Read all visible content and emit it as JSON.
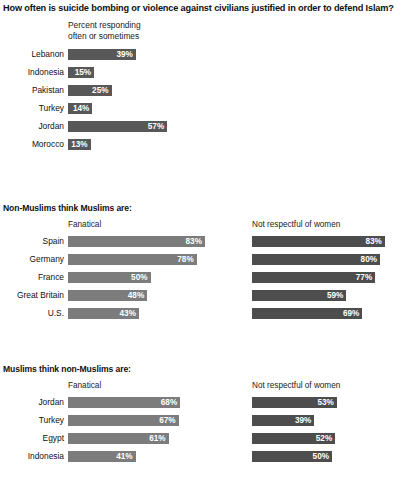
{
  "title": "How often is suicide bombing or violence against civilians justified in order to defend Islam?",
  "colors": {
    "bar_light": "#7c7c7c",
    "bar_dark": "#4d4d4d",
    "bar_solo": "#585858",
    "text": "#111111",
    "value_text": "#ffffff",
    "background": "#ffffff"
  },
  "sections": [
    {
      "heading": "",
      "note_line1": "Percent responding",
      "note_line2": "often or sometimes",
      "left_caption": "",
      "right_caption": "",
      "rows": [
        {
          "label": "Lebanon",
          "left": 39
        },
        {
          "label": "Indonesia",
          "left": 15
        },
        {
          "label": "Pakistan",
          "left": 25
        },
        {
          "label": "Turkey",
          "left": 14
        },
        {
          "label": "Jordan",
          "left": 57
        },
        {
          "label": "Morocco",
          "left": 13
        }
      ]
    },
    {
      "heading": "Non-Muslims think Muslims are:",
      "left_caption": "Fanatical",
      "right_caption": "Not respectful of women",
      "rows": [
        {
          "label": "Spain",
          "left": 83,
          "right": 83
        },
        {
          "label": "Germany",
          "left": 78,
          "right": 80
        },
        {
          "label": "France",
          "left": 50,
          "right": 77
        },
        {
          "label": "Great Britain",
          "left": 48,
          "right": 59
        },
        {
          "label": "U.S.",
          "left": 43,
          "right": 69
        }
      ]
    },
    {
      "heading": "Muslims think non-Muslims are:",
      "left_caption": "Fanatical",
      "right_caption": "Not respectful of women",
      "rows": [
        {
          "label": "Jordan",
          "left": 68,
          "right": 53
        },
        {
          "label": "Turkey",
          "left": 67,
          "right": 39
        },
        {
          "label": "Egypt",
          "left": 61,
          "right": 52
        },
        {
          "label": "Indonesia",
          "left": 41,
          "right": 50
        }
      ]
    }
  ],
  "chart_data": {
    "type": "bar",
    "title": "How often is suicide bombing or violence against civilians justified in order to defend Islam?",
    "xlabel": "",
    "ylabel": "",
    "xlim": [
      0,
      100
    ],
    "grid": false,
    "orientation": "horizontal",
    "value_suffix": "%",
    "panels": [
      {
        "heading": "",
        "subtitle": "Percent responding often or sometimes",
        "categories": [
          "Lebanon",
          "Indonesia",
          "Pakistan",
          "Turkey",
          "Jordan",
          "Morocco"
        ],
        "series": [
          {
            "name": "Percent responding often or sometimes",
            "values": [
              39,
              15,
              25,
              14,
              57,
              13
            ]
          }
        ]
      },
      {
        "heading": "Non-Muslims think Muslims are:",
        "categories": [
          "Spain",
          "Germany",
          "France",
          "Great Britain",
          "U.S."
        ],
        "series": [
          {
            "name": "Fanatical",
            "values": [
              83,
              78,
              50,
              48,
              43
            ]
          },
          {
            "name": "Not respectful of women",
            "values": [
              83,
              80,
              77,
              59,
              69
            ]
          }
        ]
      },
      {
        "heading": "Muslims think non-Muslims are:",
        "categories": [
          "Jordan",
          "Turkey",
          "Egypt",
          "Indonesia"
        ],
        "series": [
          {
            "name": "Fanatical",
            "values": [
              68,
              67,
              61,
              41
            ]
          },
          {
            "name": "Not respectful of women",
            "values": [
              53,
              39,
              52,
              50
            ]
          }
        ]
      }
    ]
  }
}
